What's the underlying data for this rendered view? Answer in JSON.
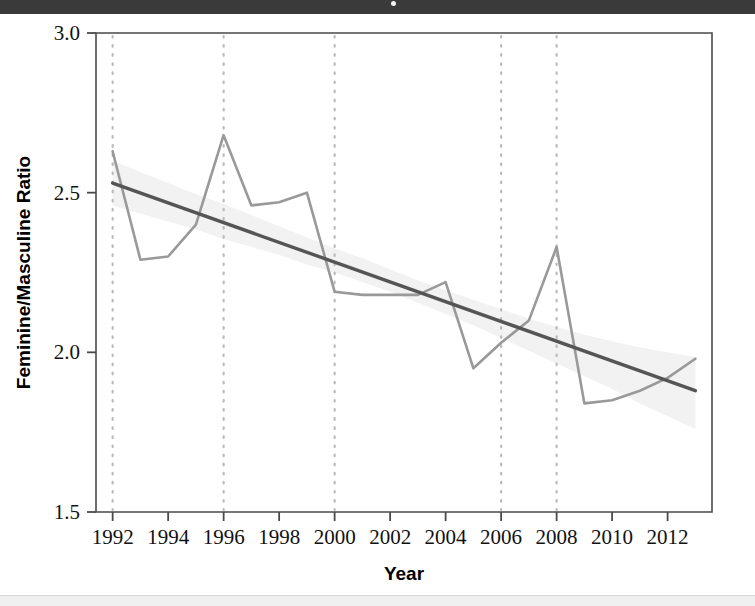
{
  "page": {
    "background_color": "#ffffff",
    "top_band_color": "#3a3a3a",
    "bottom_band_color": "#f0f0f0"
  },
  "chart_data": {
    "type": "line",
    "title": "",
    "xlabel": "Year",
    "ylabel": "Feminine/Masculine Ratio",
    "xlim": [
      1991.4,
      2013.6
    ],
    "ylim": [
      1.5,
      3.0
    ],
    "xticks": [
      1992,
      1994,
      1996,
      1998,
      2000,
      2002,
      2004,
      2006,
      2008,
      2010,
      2012
    ],
    "xtick_labels": [
      "1992",
      "1994",
      "1996",
      "1998",
      "2000",
      "2002",
      "2004",
      "2006",
      "2008",
      "2010",
      "2012"
    ],
    "yticks": [
      1.5,
      2.0,
      2.5,
      3.0
    ],
    "ytick_labels": [
      "1.5",
      "2.0",
      "2.5",
      "3.0"
    ],
    "grid": false,
    "legend": "none",
    "x": [
      1992,
      1993,
      1994,
      1995,
      1996,
      1997,
      1998,
      1999,
      2000,
      2001,
      2002,
      2003,
      2004,
      2005,
      2006,
      2007,
      2008,
      2009,
      2010,
      2011,
      2012,
      2013
    ],
    "series": [
      {
        "name": "Feminine/Masculine Ratio",
        "kind": "observed-line",
        "color": "#999999",
        "linewidth": 2.6,
        "values": [
          2.63,
          2.29,
          2.3,
          2.4,
          2.68,
          2.46,
          2.47,
          2.5,
          2.19,
          2.18,
          2.18,
          2.18,
          2.22,
          1.95,
          2.03,
          2.1,
          2.33,
          1.84,
          1.85,
          1.88,
          1.92,
          1.98
        ]
      },
      {
        "name": "Linear trend",
        "kind": "trend-line",
        "color": "#555555",
        "linewidth": 3.4,
        "endpoints": [
          {
            "x": 1992,
            "y": 2.53
          },
          {
            "x": 2013,
            "y": 1.88
          }
        ]
      },
      {
        "name": "Confidence band",
        "kind": "confidence-ribbon",
        "color": "#eeeeee",
        "opacity": 0.75,
        "upper": [
          2.6,
          2.565,
          2.53,
          2.495,
          2.465,
          2.43,
          2.395,
          2.36,
          2.325,
          2.295,
          2.26,
          2.225,
          2.195,
          2.165,
          2.135,
          2.105,
          2.08,
          2.055,
          2.035,
          2.015,
          2.0,
          1.985
        ],
        "lower": [
          2.46,
          2.435,
          2.41,
          2.385,
          2.355,
          2.33,
          2.305,
          2.275,
          2.25,
          2.22,
          2.19,
          2.155,
          2.12,
          2.085,
          2.045,
          2.005,
          1.965,
          1.925,
          1.885,
          1.84,
          1.8,
          1.76
        ]
      }
    ],
    "vertical_reference_lines": {
      "name": "election-years",
      "values": [
        1992,
        1996,
        2000,
        2006,
        2008
      ],
      "style": "dotted",
      "color": "#bbbbbb"
    }
  }
}
